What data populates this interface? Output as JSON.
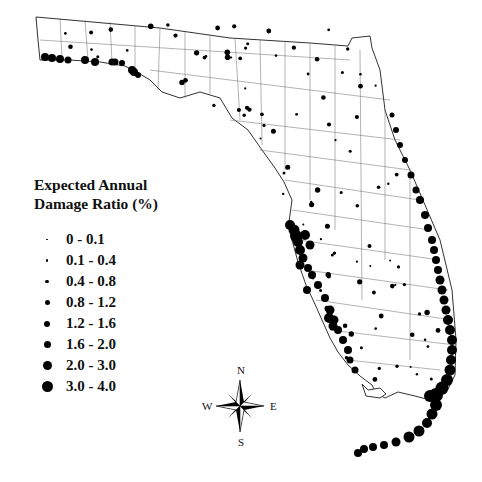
{
  "legend": {
    "title_line1": "Expected Annual",
    "title_line2": "Damage Ratio (%)",
    "items": [
      {
        "label": "0 - 0.1",
        "size": 1.5
      },
      {
        "label": "0.1 - 0.4",
        "size": 2.5
      },
      {
        "label": "0.4 - 0.8",
        "size": 3.5
      },
      {
        "label": "0.8 - 1.2",
        "size": 5
      },
      {
        "label": "1.2 - 1.6",
        "size": 6
      },
      {
        "label": "1.6 - 2.0",
        "size": 7
      },
      {
        "label": "2.0 - 3.0",
        "size": 9
      },
      {
        "label": "3.0 - 4.0",
        "size": 11
      }
    ]
  },
  "compass": {
    "n": "N",
    "s": "S",
    "e": "E",
    "w": "W"
  },
  "map": {
    "region": "Florida",
    "coastal_high_dots": [
      [
        45,
        57,
        4
      ],
      [
        52,
        58,
        4
      ],
      [
        60,
        59,
        4
      ],
      [
        68,
        60,
        3.5
      ],
      [
        85,
        60,
        4
      ],
      [
        95,
        62,
        4
      ],
      [
        112,
        62,
        3.5
      ],
      [
        115,
        62,
        3.5
      ],
      [
        122,
        63,
        3
      ],
      [
        134,
        72,
        4
      ],
      [
        132,
        70,
        4
      ],
      [
        138,
        75,
        3
      ],
      [
        290,
        225,
        5
      ],
      [
        294,
        230,
        5.5
      ],
      [
        296,
        236,
        6
      ],
      [
        298,
        242,
        5
      ],
      [
        300,
        250,
        5
      ],
      [
        303,
        258,
        4.5
      ],
      [
        308,
        268,
        4
      ],
      [
        312,
        275,
        4
      ],
      [
        318,
        285,
        4
      ],
      [
        325,
        298,
        4
      ],
      [
        330,
        310,
        4.5
      ],
      [
        334,
        320,
        4.5
      ],
      [
        338,
        330,
        4
      ],
      [
        343,
        340,
        4
      ],
      [
        348,
        350,
        4
      ],
      [
        350,
        360,
        3.5
      ],
      [
        355,
        370,
        3.5
      ],
      [
        305,
        235,
        5
      ],
      [
        310,
        245,
        4.5
      ],
      [
        300,
        265,
        4.5
      ],
      [
        307,
        290,
        4
      ],
      [
        329,
        318,
        5
      ],
      [
        333,
        326,
        4.5
      ],
      [
        432,
        240,
        4
      ],
      [
        434,
        250,
        4
      ],
      [
        436,
        260,
        4
      ],
      [
        438,
        270,
        4
      ],
      [
        440,
        280,
        4.5
      ],
      [
        442,
        290,
        4.5
      ],
      [
        444,
        300,
        4.5
      ],
      [
        446,
        310,
        4.5
      ],
      [
        448,
        320,
        5
      ],
      [
        450,
        330,
        5
      ],
      [
        452,
        340,
        5
      ],
      [
        452,
        350,
        5
      ],
      [
        451,
        360,
        5
      ],
      [
        450,
        370,
        5.5
      ],
      [
        447,
        380,
        6
      ],
      [
        442,
        388,
        6.5
      ],
      [
        436,
        395,
        7
      ],
      [
        430,
        396,
        6
      ],
      [
        436,
        405,
        6
      ],
      [
        432,
        414,
        5.5
      ],
      [
        427,
        423,
        5
      ],
      [
        419,
        431,
        5.5
      ],
      [
        409,
        437,
        5.5
      ],
      [
        396,
        442,
        4.5
      ],
      [
        384,
        445,
        4
      ],
      [
        373,
        447,
        4
      ],
      [
        364,
        449,
        4
      ],
      [
        358,
        453,
        4
      ],
      [
        420,
        200,
        4
      ],
      [
        425,
        215,
        4
      ],
      [
        428,
        228,
        4
      ],
      [
        416,
        190,
        3.5
      ],
      [
        411,
        175,
        3.5
      ],
      [
        405,
        160,
        3
      ],
      [
        400,
        145,
        3
      ],
      [
        396,
        130,
        3
      ],
      [
        392,
        115,
        2.5
      ]
    ]
  }
}
